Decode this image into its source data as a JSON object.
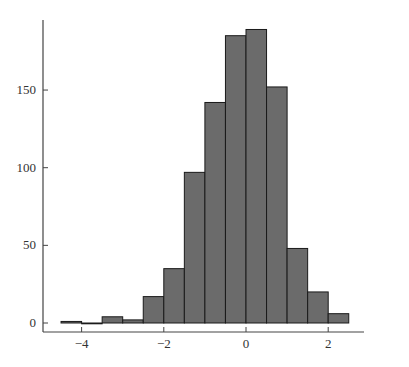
{
  "chart_data": {
    "type": "bar",
    "title": "",
    "xlabel": "",
    "ylabel": "",
    "bin_edges": [
      -4.5,
      -4.0,
      -3.5,
      -3.0,
      -2.5,
      -2.0,
      -1.5,
      -1.0,
      -0.5,
      0.0,
      0.5,
      1.0,
      1.5,
      2.0,
      2.5,
      3.0
    ],
    "values": [
      1,
      0,
      4,
      2,
      17,
      35,
      97,
      142,
      185,
      189,
      152,
      48,
      20,
      6
    ],
    "xlim": [
      -4.9,
      3.6
    ],
    "ylim": [
      -5,
      193
    ],
    "xticks": [
      -4,
      -2,
      0,
      2
    ],
    "xtick_labels": [
      "−4",
      "−2",
      "0",
      "2"
    ],
    "yticks": [
      0,
      50,
      100,
      150
    ],
    "ytick_labels": [
      "0",
      "50",
      "100",
      "150"
    ],
    "grid": false,
    "legend": null,
    "bar_color": "#6b6b6b",
    "edge_color": "#1a1a1a"
  }
}
